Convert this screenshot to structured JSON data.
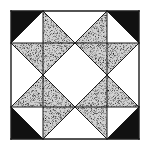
{
  "diagram": {
    "type": "quilt-block",
    "grid": {
      "origin": [
        11,
        11
      ],
      "cell": 32,
      "rows": 4,
      "cols": 4
    },
    "colors": {
      "background": "#ffffff",
      "dark": "#111111",
      "stipple_base": "#c8c8c8",
      "stipple_dot": "#1a1a1a",
      "line": "#1a1a1a"
    },
    "pieces": [
      {
        "name": "corner-tl-dark",
        "fill": "dark",
        "points": "11,11 43,11 11,43"
      },
      {
        "name": "corner-tr-dark",
        "fill": "dark",
        "points": "107,11 139,11 139,43"
      },
      {
        "name": "corner-bl-dark",
        "fill": "dark",
        "points": "11,107 11,139 43,139"
      },
      {
        "name": "corner-br-dark",
        "fill": "dark",
        "points": "139,107 139,139 107,139"
      },
      {
        "name": "tl-point-top",
        "fill": "stipple",
        "points": "43,11 43,43 75,43"
      },
      {
        "name": "tl-point-left",
        "fill": "stipple",
        "points": "11,43 43,43 43,75"
      },
      {
        "name": "tl-point-inner",
        "fill": "stipple",
        "points": "43,43 75,43 43,75"
      },
      {
        "name": "tr-point-top",
        "fill": "stipple",
        "points": "107,11 107,43 75,43"
      },
      {
        "name": "tr-point-right",
        "fill": "stipple",
        "points": "107,43 139,43 107,75"
      },
      {
        "name": "tr-point-inner",
        "fill": "stipple",
        "points": "75,43 107,43 107,75"
      },
      {
        "name": "bl-point-left",
        "fill": "stipple",
        "points": "11,107 43,75 43,107"
      },
      {
        "name": "bl-point-inner",
        "fill": "stipple",
        "points": "43,75 43,107 75,107"
      },
      {
        "name": "bl-point-bottom",
        "fill": "stipple",
        "points": "43,107 75,107 43,139"
      },
      {
        "name": "br-point-inner",
        "fill": "stipple",
        "points": "107,75 107,107 75,107"
      },
      {
        "name": "br-point-right",
        "fill": "stipple",
        "points": "107,75 139,107 107,107"
      },
      {
        "name": "br-point-bottom",
        "fill": "stipple",
        "points": "75,107 107,107 107,139"
      }
    ],
    "lines": [
      "11,11 139,11",
      "139,11 139,139",
      "139,139 11,139",
      "11,139 11,11",
      "43,11 11,43",
      "107,11 139,43",
      "11,107 43,139",
      "139,107 107,139",
      "43,11 75,43",
      "75,43 43,75",
      "43,75 11,43",
      "107,11 75,43",
      "75,43 107,75",
      "107,75 139,43",
      "11,107 43,75",
      "43,75 75,107",
      "75,107 43,139",
      "107,75 75,107",
      "75,107 107,139",
      "107,75 139,107",
      "43,11 43,75",
      "11,43 75,43",
      "107,11 107,75",
      "75,43 139,43",
      "43,75 43,139",
      "11,107 75,107",
      "107,75 107,139",
      "75,107 139,107"
    ]
  }
}
